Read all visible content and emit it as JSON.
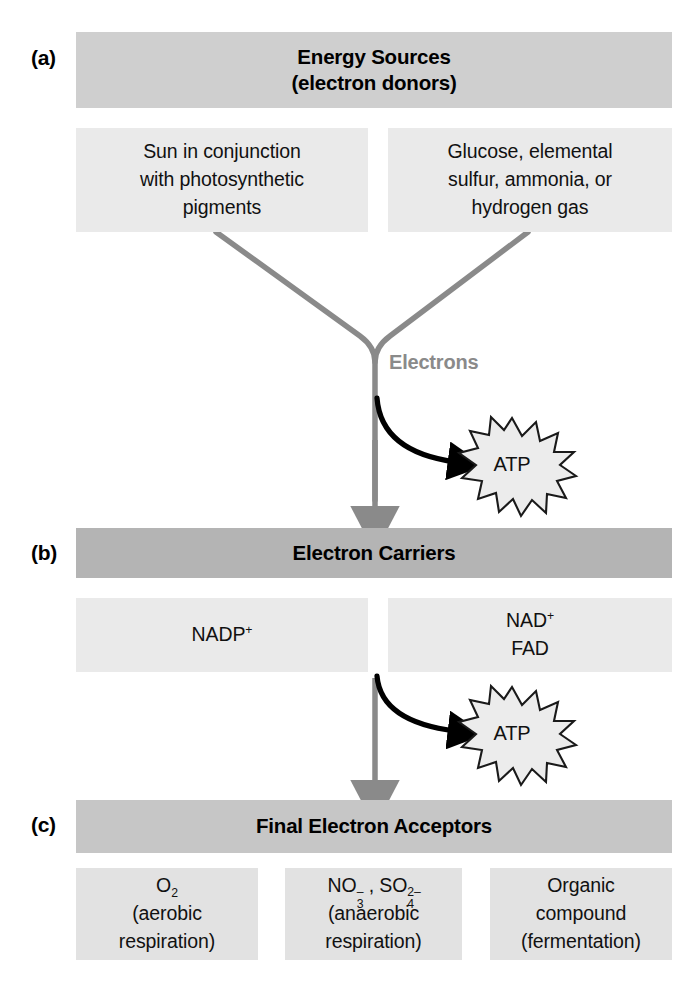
{
  "figure": {
    "background_color": "#ffffff",
    "width": 698,
    "height": 988
  },
  "panels": {
    "a": {
      "letter": "(a)",
      "header": {
        "line1": "Energy Sources",
        "line2": "(electron donors)",
        "color": "#cfcfcf"
      },
      "boxes": [
        {
          "line1": "Sun in conjunction",
          "line2": "with photosynthetic",
          "line3": "pigments",
          "color": "#eaeaea"
        },
        {
          "line1": "Glucose, elemental",
          "line2": "sulfur, ammonia, or",
          "line3": "hydrogen gas",
          "color": "#eaeaea"
        }
      ]
    },
    "b": {
      "letter": "(b)",
      "header": {
        "line1": "Electron Carriers",
        "color": "#b4b4b4"
      },
      "boxes": [
        {
          "formula_base": "NADP",
          "formula_sup": "+",
          "color": "#eaeaea"
        },
        {
          "formula_base": "NAD",
          "formula_sup": "+",
          "line2": "FAD",
          "color": "#eaeaea"
        }
      ]
    },
    "c": {
      "letter": "(c)",
      "header": {
        "line1": "Final Electron Acceptors",
        "color": "#c6c6c6"
      },
      "boxes": [
        {
          "formula_base": "O",
          "formula_sub": "2",
          "line2": "(aerobic",
          "line3": "respiration)",
          "color": "#e2e2e2"
        },
        {
          "formula1_base": "NO",
          "formula1_sub": "3",
          "formula1_sup": "–",
          "separator": ", ",
          "formula2_base": "SO",
          "formula2_sub": "4",
          "formula2_sup": "2–",
          "line2": "(anaerobic",
          "line3": "respiration)",
          "color": "#e2e2e2"
        },
        {
          "line1": "Organic",
          "line2": "compound",
          "line3": "(fermentation)",
          "color": "#e2e2e2"
        }
      ]
    }
  },
  "annotations": {
    "electrons_label": "Electrons",
    "electrons_label_color": "#8a8a8a",
    "atp_label_1": "ATP",
    "atp_label_2": "ATP",
    "flow_arrow_color": "#8a8a8a",
    "atp_arrow_color": "#000000",
    "burst_fill_color": "#ececec",
    "burst_stroke_color": "#1a1a1a"
  }
}
